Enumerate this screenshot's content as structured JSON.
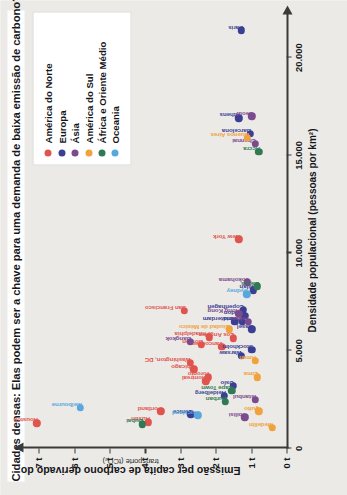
{
  "chart_title": "Cidades densas: Elas podem ser a chave para uma demanda de baixa emissão de carbono?",
  "axes": {
    "x_title": "Densidade populacional (pessoas por km²)",
    "y_title": "Emissão per capita de carbono derivado do",
    "y_subtitle": "transporte (tCO₂)",
    "x_ticks": [
      "0",
      "5.000",
      "10.000",
      "15.000",
      "20.000"
    ],
    "y_ticks": [
      "0 t",
      "1 t",
      "2 t",
      "3 t",
      "4 t",
      "5 t",
      "6 t",
      "7 t"
    ]
  },
  "legend": {
    "items": [
      {
        "label": "América do Norte",
        "color": "#e0544e"
      },
      {
        "label": "Europa",
        "color": "#3b3f94"
      },
      {
        "label": "Ásia",
        "color": "#7b4b8e"
      },
      {
        "label": "América do Sul",
        "color": "#f0a23c"
      },
      {
        "label": "África e Oriente Médio",
        "color": "#2f7a52"
      },
      {
        "label": "Oceania",
        "color": "#59a8dd"
      }
    ]
  },
  "chart_data": {
    "type": "scatter",
    "title": "Cidades densas: Elas podem ser a chave para uma demanda de baixa emissão de carbono?",
    "xlabel": "Densidade populacional (pessoas por km²)",
    "ylabel": "Emissão per capita de carbono derivado do transporte (tCO₂)",
    "xlim": [
      0,
      22000
    ],
    "ylim": [
      0,
      7.4
    ],
    "grid": false,
    "legend_position": "top-right",
    "series": [
      {
        "name": "América do Norte",
        "color": "#e0544e",
        "points": [
          {
            "label": "Houston",
            "x": 1300,
            "y": 7.05
          },
          {
            "label": "Portland",
            "x": 1900,
            "y": 3.55
          },
          {
            "label": "Austin",
            "x": 1350,
            "y": 3.9
          },
          {
            "label": "Chicago",
            "x": 4050,
            "y": 2.62
          },
          {
            "label": "San Francisco",
            "x": 7050,
            "y": 2.88
          },
          {
            "label": "Washington, DC",
            "x": 4400,
            "y": 2.72
          },
          {
            "label": "Montreal",
            "x": 3450,
            "y": 2.28
          },
          {
            "label": "Toronto",
            "x": 3650,
            "y": 2.2
          },
          {
            "label": "Boston",
            "x": 5300,
            "y": 2.4
          },
          {
            "label": "Philadelphia",
            "x": 5700,
            "y": 2.18
          },
          {
            "label": "Vancouver",
            "x": 5200,
            "y": 1.83
          },
          {
            "label": "Los Angeles",
            "x": 5650,
            "y": 1.5
          },
          {
            "label": "New York",
            "x": 10700,
            "y": 1.35
          }
        ]
      },
      {
        "name": "Europa",
        "color": "#3b3f94",
        "points": [
          {
            "label": "Paris",
            "x": 21400,
            "y": 1.27
          },
          {
            "label": "Athens",
            "x": 16900,
            "y": 1.35
          },
          {
            "label": "Barcelona",
            "x": 16100,
            "y": 1.02
          },
          {
            "label": "Venice",
            "x": 1750,
            "y": 2.7
          },
          {
            "label": "Amsterdam",
            "x": 6500,
            "y": 1.46
          },
          {
            "label": "Copenhagen",
            "x": 7100,
            "y": 1.22
          },
          {
            "label": "London",
            "x": 6800,
            "y": 1.18
          },
          {
            "label": "Madrid",
            "x": 6500,
            "y": 1.25
          },
          {
            "label": "Basel",
            "x": 6100,
            "y": 0.98
          },
          {
            "label": "Milan",
            "x": 8100,
            "y": 0.93
          },
          {
            "label": "Stockholm",
            "x": 5050,
            "y": 0.98
          },
          {
            "label": "Warsaw",
            "x": 4750,
            "y": 1.28
          },
          {
            "label": "Oslo",
            "x": 3200,
            "y": 1.5
          },
          {
            "label": "Heidelberg",
            "x": 2700,
            "y": 1.75
          }
        ]
      },
      {
        "name": "Ásia",
        "color": "#7b4b8e",
        "points": [
          {
            "label": "Seoul",
            "x": 17000,
            "y": 0.98
          },
          {
            "label": "Chennai",
            "x": 15600,
            "y": 0.88
          },
          {
            "label": "Bangkok",
            "x": 5450,
            "y": 2.72
          },
          {
            "label": "Hong Kong",
            "x": 6900,
            "y": 1.35
          },
          {
            "label": "Tokyo",
            "x": 6500,
            "y": 1.08
          },
          {
            "label": "Yokohama",
            "x": 8500,
            "y": 1.1
          },
          {
            "label": "Istanbul",
            "x": 2500,
            "y": 0.88
          },
          {
            "label": "Tbilisi",
            "x": 1600,
            "y": 1.18
          }
        ]
      },
      {
        "name": "América do Sul",
        "color": "#f0a23c",
        "points": [
          {
            "label": "Buenos Aires",
            "x": 15900,
            "y": 1.1
          },
          {
            "label": "Ciudad de México",
            "x": 6100,
            "y": 1.62
          },
          {
            "label": "Lima",
            "x": 3650,
            "y": 0.83
          },
          {
            "label": "Quito",
            "x": 1900,
            "y": 0.78
          },
          {
            "label": "Medellín",
            "x": 1050,
            "y": 0.4
          },
          {
            "label": "Aman",
            "x": 4500,
            "y": 0.88
          }
        ]
      },
      {
        "name": "África e Oriente Médio",
        "color": "#2f7a52",
        "points": [
          {
            "label": "Accra",
            "x": 15200,
            "y": 0.78
          },
          {
            "label": "Lagos",
            "x": 8300,
            "y": 0.82
          },
          {
            "label": "Dubai",
            "x": 1250,
            "y": 4.08
          },
          {
            "label": "Durban",
            "x": 2400,
            "y": 1.72
          },
          {
            "label": "Cape Town",
            "x": 2950,
            "y": 1.55
          }
        ]
      },
      {
        "name": "Oceania",
        "color": "#59a8dd",
        "points": [
          {
            "label": "Melbourne",
            "x": 2100,
            "y": 5.82
          },
          {
            "label": "Auckland",
            "x": 1700,
            "y": 2.5
          },
          {
            "label": "Sydney",
            "x": 7900,
            "y": 1.12
          }
        ]
      }
    ]
  }
}
